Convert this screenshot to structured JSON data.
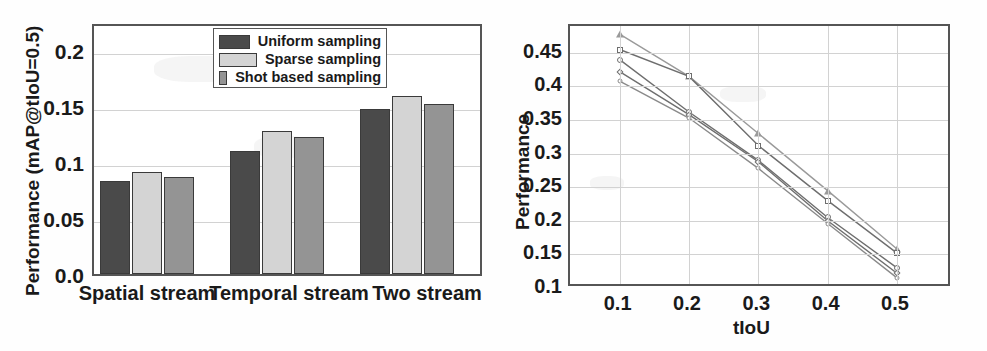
{
  "figure": {
    "panels": [
      "bar-chart-panel",
      "line-chart-panel"
    ]
  },
  "chart_data": [
    {
      "id": "left",
      "type": "bar",
      "title": "",
      "xlabel": "",
      "ylabel": "Performance (mAP@tIoU=0.5)",
      "categories": [
        "Spatial stream",
        "Temporal stream",
        "Two stream"
      ],
      "ylim": [
        0.0,
        0.225
      ],
      "yticks": [
        "0.0",
        "0.05",
        "0.1",
        "0.15",
        "0.2"
      ],
      "ytick_values": [
        0.0,
        0.05,
        0.1,
        0.15,
        0.2
      ],
      "grid": true,
      "legend_position": "top-right",
      "series": [
        {
          "name": "Uniform sampling",
          "color": "#4a4a4a",
          "values": [
            0.083,
            0.11,
            0.147
          ]
        },
        {
          "name": "Sparse sampling",
          "color": "#d4d4d4",
          "values": [
            0.091,
            0.128,
            0.159
          ]
        },
        {
          "name": "Shot based sampling",
          "color": "#949494",
          "values": [
            0.087,
            0.122,
            0.152
          ]
        }
      ]
    },
    {
      "id": "right",
      "type": "line",
      "title": "",
      "xlabel": "tIoU",
      "ylabel": "Performance",
      "x": [
        0.1,
        0.2,
        0.3,
        0.4,
        0.5
      ],
      "xticks": [
        "0.1",
        "0.2",
        "0.3",
        "0.4",
        "0.5"
      ],
      "ylim": [
        0.1,
        0.49
      ],
      "yticks": [
        "0.1",
        "0.15",
        "0.2",
        "0.25",
        "0.3",
        "0.35",
        "0.4",
        "0.45"
      ],
      "ytick_values": [
        0.1,
        0.15,
        0.2,
        0.25,
        0.3,
        0.35,
        0.4,
        0.45
      ],
      "grid": true,
      "legend_position": "top-right",
      "series": [
        {
          "name": "0.3",
          "marker": "circle",
          "color": "#6e6e6e",
          "values": [
            0.44,
            0.362,
            0.29,
            0.205,
            0.13
          ]
        },
        {
          "name": "0.4",
          "marker": "triangle",
          "color": "#9a9a9a",
          "values": [
            0.478,
            0.415,
            0.33,
            0.245,
            0.158
          ]
        },
        {
          "name": "0.5",
          "marker": "square",
          "color": "#6e6e6e",
          "values": [
            0.455,
            0.415,
            0.312,
            0.23,
            0.152
          ]
        },
        {
          "name": "0.6",
          "marker": "diamond",
          "color": "#6e6e6e",
          "values": [
            0.422,
            0.358,
            0.288,
            0.2,
            0.122
          ]
        },
        {
          "name": "0.7",
          "marker": "dot",
          "color": "#8a8a8a",
          "values": [
            0.408,
            0.353,
            0.278,
            0.196,
            0.115
          ]
        }
      ]
    }
  ]
}
